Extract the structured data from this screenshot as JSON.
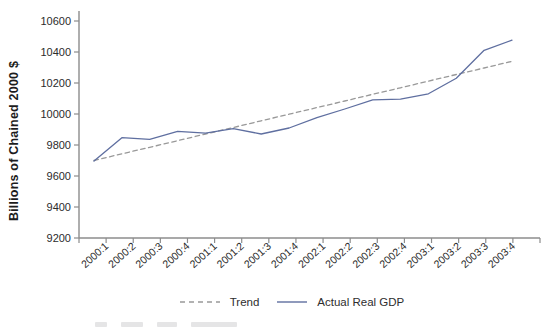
{
  "colors": {
    "actual_line": "#5f6fa0",
    "trend_line": "#999999",
    "axis": "#8c8c8c",
    "tick_text": "#2b2b2b"
  },
  "chart_data": {
    "type": "line",
    "title": "",
    "xlabel": "",
    "ylabel": "Billions of Chained 2000 $",
    "ylim": [
      9200,
      10600
    ],
    "ytick_step": 200,
    "ytick_labels": [
      "9200",
      "9400",
      "9600",
      "9800",
      "10000",
      "10200",
      "10400",
      "10600"
    ],
    "grid": false,
    "legend_position": "bottom-center",
    "categories": [
      "2000:1",
      "2000:2",
      "2000:3",
      "2000:4",
      "2001:1",
      "2001:2",
      "2001:3",
      "2001:4",
      "2002:1",
      "2002:2",
      "2002:3",
      "2002:4",
      "2003:1",
      "2003:2",
      "2003:3",
      "2003:4"
    ],
    "series": [
      {
        "name": "Trend",
        "style": "dashed",
        "color": "#999999",
        "values": [
          9700,
          9743,
          9785,
          9828,
          9871,
          9913,
          9956,
          9999,
          10041,
          10084,
          10127,
          10169,
          10212,
          10255,
          10297,
          10340
        ]
      },
      {
        "name": "Actual Real GDP",
        "style": "solid",
        "color": "#5f6fa0",
        "values": [
          9696,
          9847,
          9837,
          9888,
          9876,
          9906,
          9871,
          9910,
          9977,
          10032,
          10091,
          10096,
          10130,
          10230,
          10411,
          10476
        ]
      }
    ]
  }
}
